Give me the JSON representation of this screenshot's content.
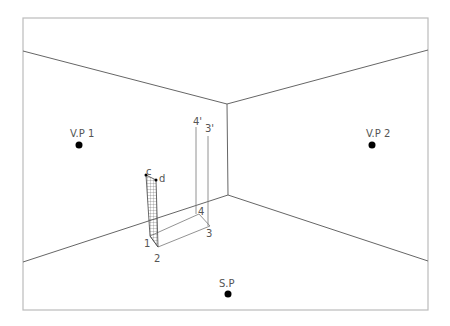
{
  "diagram": {
    "labels": {
      "vp1": "V.P 1",
      "vp2": "V.P 2",
      "sp": "S.P",
      "p1": "1",
      "p2": "2",
      "p3": "3",
      "p4": "4",
      "p3_prime": "3'",
      "p4_prime": "4'",
      "c": "c",
      "d": "d"
    },
    "colors": {
      "line": "#666666",
      "frame": "#bbbbbb",
      "point": "#000000",
      "text": "#555555"
    }
  }
}
